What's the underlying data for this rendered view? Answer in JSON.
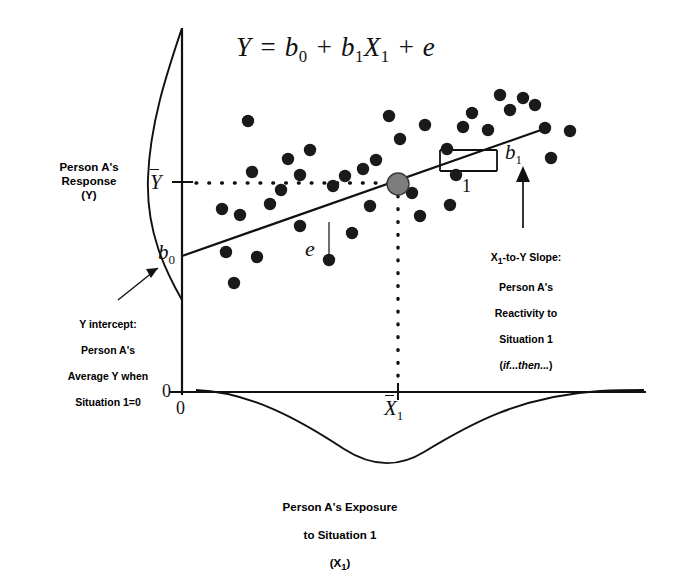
{
  "figure": {
    "equation": "Y = b0 + b1X1 + e",
    "equation_parts": {
      "lhs": "Y",
      "eq": "=",
      "intercept": "b",
      "intercept_sub": "0",
      "plus1": "+",
      "slope": "b",
      "slope_sub": "1",
      "predictor": "X",
      "predictor_sub": "1",
      "plus2": "+",
      "error": "e"
    }
  },
  "y_axis": {
    "label": "Person A's\nResponse\n(Y)",
    "mean_symbol": "Y",
    "mean_symbol_full": "Y-bar",
    "origin_tick": "0"
  },
  "x_axis": {
    "label": "Person A's Exposure\nto Situation 1\n(X1)",
    "label_line1": "Person A's Exposure",
    "label_line2": "to Situation 1",
    "label_line3": "(X",
    "label_sub": "1",
    "mean_symbol": "X",
    "mean_symbol_sub": "1",
    "origin_tick": "0"
  },
  "annotations": {
    "intercept": {
      "symbol": "b",
      "symbol_sub": "0",
      "text_line1": "Y intercept:",
      "text_line2": "Person A's",
      "text_line3": "Average Y when",
      "text_line4": "Situation 1=0"
    },
    "slope": {
      "symbol": "b",
      "symbol_sub": "1",
      "run_label": "1",
      "text_line1_a": "X",
      "text_line1_sub": "1",
      "text_line1_b": "-to-Y Slope:",
      "text_line2": "Person A's",
      "text_line3": "Reactivity to",
      "text_line4": "Situation 1",
      "text_line5": "(if...then...)",
      "text_line5_italic": "if...then..."
    },
    "residual": {
      "symbol": "e"
    }
  },
  "colors": {
    "ink": "#111111",
    "point_fill": "#1a1a1a",
    "centroid_fill": "#7d7d7d",
    "centroid_stroke": "#3a3a3a",
    "background": "#ffffff"
  },
  "chart_data": {
    "type": "scatter",
    "title": "Y = b0 + b1X1 + e",
    "xlabel": "Person A's Exposure to Situation 1 (X1)",
    "ylabel": "Person A's Response (Y)",
    "grid": false,
    "legend": "none",
    "axis_origin_label": "0",
    "regression_line": {
      "x_start": 182,
      "y_start": 256,
      "x_end": 541,
      "y_end": 130,
      "intercept_label": "b0",
      "slope_label": "b1",
      "run_label": "1"
    },
    "mean_lines": {
      "y_mean_label": "Y-bar",
      "y_mean_pixel": 182,
      "x_mean_label": "X1-bar",
      "x_mean_pixel": 398,
      "style": "dotted"
    },
    "centroid": {
      "x": 398,
      "y": 184,
      "r": 11
    },
    "residual_segment": {
      "x": 329,
      "y_line": 222,
      "y_point": 260,
      "label": "e"
    },
    "slope_triangle": {
      "x_left": 440,
      "x_right": 497,
      "y_top": 150,
      "y_bottom": 171
    },
    "points": [
      {
        "x": 222,
        "y": 209
      },
      {
        "x": 240,
        "y": 215
      },
      {
        "x": 226,
        "y": 252
      },
      {
        "x": 234,
        "y": 283
      },
      {
        "x": 252,
        "y": 172
      },
      {
        "x": 257,
        "y": 257
      },
      {
        "x": 248,
        "y": 121
      },
      {
        "x": 270,
        "y": 204
      },
      {
        "x": 281,
        "y": 190
      },
      {
        "x": 288,
        "y": 159
      },
      {
        "x": 300,
        "y": 175
      },
      {
        "x": 300,
        "y": 226
      },
      {
        "x": 310,
        "y": 150
      },
      {
        "x": 329,
        "y": 260
      },
      {
        "x": 333,
        "y": 186
      },
      {
        "x": 345,
        "y": 176
      },
      {
        "x": 352,
        "y": 233
      },
      {
        "x": 363,
        "y": 169
      },
      {
        "x": 370,
        "y": 206
      },
      {
        "x": 376,
        "y": 160
      },
      {
        "x": 389,
        "y": 116
      },
      {
        "x": 400,
        "y": 139
      },
      {
        "x": 412,
        "y": 193
      },
      {
        "x": 420,
        "y": 216
      },
      {
        "x": 425,
        "y": 125
      },
      {
        "x": 447,
        "y": 149
      },
      {
        "x": 450,
        "y": 205
      },
      {
        "x": 456,
        "y": 175
      },
      {
        "x": 463,
        "y": 127
      },
      {
        "x": 472,
        "y": 113
      },
      {
        "x": 488,
        "y": 130
      },
      {
        "x": 500,
        "y": 95
      },
      {
        "x": 510,
        "y": 110
      },
      {
        "x": 523,
        "y": 98
      },
      {
        "x": 535,
        "y": 105
      },
      {
        "x": 545,
        "y": 128
      },
      {
        "x": 551,
        "y": 158
      },
      {
        "x": 570,
        "y": 131
      }
    ],
    "y_distribution": {
      "shape": "normal-curve",
      "orientation": "vertical-left-of-axis",
      "peak_at": "Y-bar"
    },
    "x_distribution": {
      "shape": "normal-curve",
      "orientation": "horizontal-below-axis",
      "peak_at": "near X1-bar"
    }
  }
}
